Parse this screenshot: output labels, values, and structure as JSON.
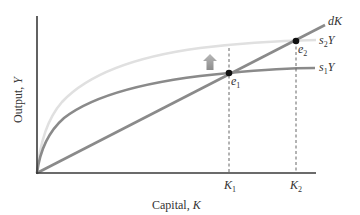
{
  "diagram": {
    "type": "solow-growth-saving-increase",
    "axes": {
      "x_label": "Capital, ",
      "x_var": "K",
      "y_label": "Output, ",
      "y_var": "Y"
    },
    "curves": {
      "depreciation": {
        "label": "dK",
        "color": "#8a8a8a"
      },
      "s1Y": {
        "label_s": "s",
        "label_sub": "1",
        "label_Y": "Y",
        "color": "#8a8a8a"
      },
      "s2Y": {
        "label_s": "s",
        "label_sub": "2",
        "label_Y": "Y",
        "color": "#dcdcdc"
      }
    },
    "points": {
      "e1": {
        "label": "e",
        "sub": "1"
      },
      "e2": {
        "label": "e",
        "sub": "2"
      }
    },
    "ticks": {
      "K1": {
        "label": "K",
        "sub": "1"
      },
      "K2": {
        "label": "K",
        "sub": "2"
      }
    },
    "shift_arrow": {
      "direction": "up",
      "color": "#9a9a9a"
    },
    "colors": {
      "axis": "#3a3a3a",
      "point": "#111111",
      "dashed": "#555555"
    }
  }
}
